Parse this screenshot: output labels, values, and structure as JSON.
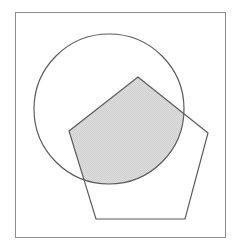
{
  "figure": {
    "canvas": {
      "width": 237,
      "height": 248,
      "background": "#ffffff"
    },
    "frame": {
      "name": "outer-border",
      "x": 15,
      "y": 12,
      "width": 211,
      "height": 226,
      "stroke": "#8c8c8c",
      "stroke_width": 1,
      "fill": "none"
    },
    "shapes": [
      {
        "name": "circle",
        "type": "circle",
        "cx": 109,
        "cy": 109,
        "r": 75,
        "stroke": "#5a5a5a",
        "stroke_width": 1.2,
        "fill": "none"
      },
      {
        "name": "pentagon",
        "type": "polygon",
        "points": "138,77 208,133 185,219 96,219 69,131",
        "vertices": [
          {
            "label": "apex",
            "x": 138,
            "y": 77
          },
          {
            "label": "right",
            "x": 208,
            "y": 133
          },
          {
            "label": "bottom-right",
            "x": 185,
            "y": 219
          },
          {
            "label": "bottom-left",
            "x": 96,
            "y": 219
          },
          {
            "label": "left",
            "x": 69,
            "y": 131
          }
        ],
        "stroke": "#5a5a5a",
        "stroke_width": 1.2,
        "fill": "none"
      }
    ],
    "intersection": {
      "name": "overlap-region",
      "description": "Shaded region where the circle and the pentagon overlap",
      "fill": "#d6d6d6",
      "fill_pattern": "dither-checker",
      "stroke": "#5a5a5a",
      "stroke_width": 1.2
    },
    "colors": {
      "background": "#ffffff",
      "frame_stroke": "#8c8c8c",
      "shape_stroke": "#5a5a5a",
      "shade_fill": "#d6d6d6",
      "shade_fill_light": "#e3e3e3"
    }
  }
}
